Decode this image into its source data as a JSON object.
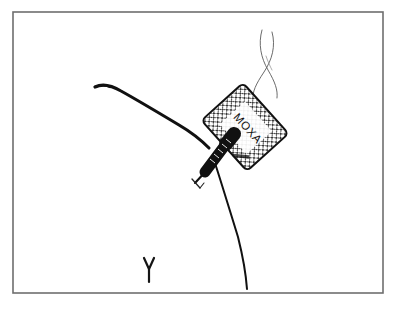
{
  "figure": {
    "background_color": "#ffffff",
    "ink_color": "#111111",
    "frame": {
      "label": "figure-border",
      "color": "#6e6e6e",
      "x": 13,
      "y": 12,
      "width": 370,
      "height": 281,
      "stroke_width": 1.6
    },
    "labels": {
      "moxa_tag_text": "MOXA",
      "figure_number": "٢"
    },
    "elements": [
      {
        "name": "skin-contour-line",
        "description": "thick curved contour sweeping from upper left down to the needle insertion point"
      },
      {
        "name": "skin-contour-lower-line",
        "description": "thin curved contour descending from the insertion point to bottom of frame"
      },
      {
        "name": "needle-shaft",
        "description": "dark ribbed needle angled down-left from the moxa tag"
      },
      {
        "name": "needle-tip-tick",
        "description": "small tick mark beside the needle tip"
      },
      {
        "name": "moxa-tag",
        "description": "rotated rounded-rectangle tag with cross-hatch mesh pattern labelled MOXA"
      },
      {
        "name": "smoke-thread-left",
        "description": "thin wavy thread rising from the tag to upper right"
      },
      {
        "name": "smoke-thread-right",
        "description": "second thin wavy thread crossing the first"
      }
    ],
    "strokes": {
      "skin_contour_main": "M 96 88 C 104 84 112 86 122 92 C 140 102 160 114 180 126 C 192 133 200 140 208 148",
      "skin_contour_lower": "M 212 156 C 219 176 228 206 238 236 C 243 256 246 274 248 289",
      "needle_shaft_outline": "M 228 140 L 200 177",
      "needle_tip": "M 207 169 L 196 182",
      "tick_mark": "M 193 180 L 203 188 M 203 188 L 206 184",
      "smoke_thread_a": "M 262 30 C 258 44 261 58 268 70 C 275 82 278 90 277 98",
      "smoke_thread_b": "M 272 32 C 276 46 272 60 264 72 C 256 84 252 92 253 100"
    },
    "moxa_tag_geometry": {
      "center_x": 245,
      "center_y": 127,
      "width": 56,
      "height": 68,
      "rotation_degrees": -42,
      "corner_radius": 5,
      "hatch_spacing": 6,
      "text_rotation_degrees": 48
    }
  }
}
